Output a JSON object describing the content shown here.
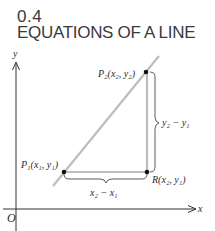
{
  "section": {
    "number": "0.4",
    "title": "EQUATIONS OF A LINE"
  },
  "diagram": {
    "axes": {
      "x_label": "x",
      "y_label": "y",
      "origin_label": "O"
    },
    "points": {
      "p1": {
        "label": "P₁(x₁, y₁)"
      },
      "p2": {
        "label": "P₂(x₂, y₂)"
      },
      "r": {
        "label": "R(x₂, y₁)"
      }
    },
    "braces": {
      "horizontal": "x₂ − x₁",
      "vertical": "y₂ − y₁"
    },
    "colors": {
      "line": "#bdbdbd",
      "axis": "#333333",
      "point": "#111111",
      "text": "#2a2a2a"
    }
  }
}
